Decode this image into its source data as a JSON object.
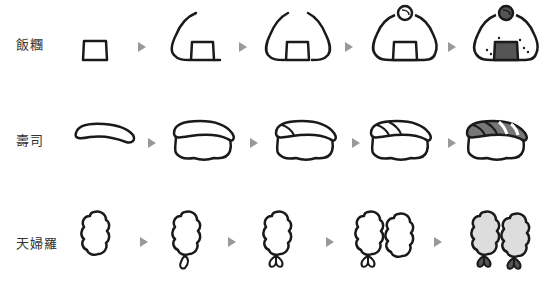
{
  "rows": [
    {
      "label": "飯糰",
      "name": "onigiri",
      "steps": 5
    },
    {
      "label": "壽司",
      "name": "sushi",
      "steps": 5
    },
    {
      "label": "天婦羅",
      "name": "tempura",
      "steps": 5
    }
  ],
  "colors": {
    "outline": "#1a1a1a",
    "arrow": "#999999",
    "nori": "#555555",
    "fish": "#777777",
    "batter": "#dddddd",
    "tail": "#555555"
  }
}
